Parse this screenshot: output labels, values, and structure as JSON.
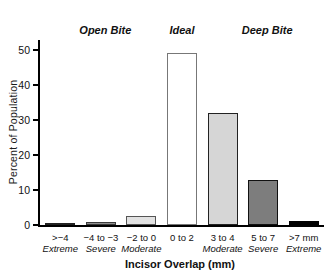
{
  "chart_data": {
    "type": "bar",
    "title": "",
    "xlabel": "Incisor Overlap (mm)",
    "ylabel": "Percent of Population",
    "ylim": [
      0,
      52.9
    ],
    "yticks": [
      0,
      10,
      20,
      30,
      40,
      50
    ],
    "grid": false,
    "legend": "none",
    "categories": [
      ">−4",
      "−4 to −3",
      "−2 to 0",
      "0 to 2",
      "3 to 4",
      "5 to 7",
      ">7 mm"
    ],
    "category_sublabels": [
      "Extreme",
      "Severe",
      "Moderate",
      "",
      "Moderate",
      "Severe",
      "Extreme"
    ],
    "values": [
      0.6,
      1.0,
      2.7,
      49.3,
      32,
      13,
      1.2
    ],
    "bar_fill_colors": [
      "#595959",
      "#8f8f8f",
      "#e2e2e2",
      "#ffffff",
      "#d6d6d6",
      "#7d7d7d",
      "#000000"
    ],
    "bar_border_colors": [
      "#222222",
      "#3a3a3a",
      "#555555",
      "#777777",
      "#222222",
      "#111111",
      "#000000"
    ],
    "group_annotations": [
      {
        "label": "Open Bite",
        "x_pct": 23
      },
      {
        "label": "Ideal",
        "x_pct": 50
      },
      {
        "label": "Deep Bite",
        "x_pct": 80
      }
    ]
  }
}
